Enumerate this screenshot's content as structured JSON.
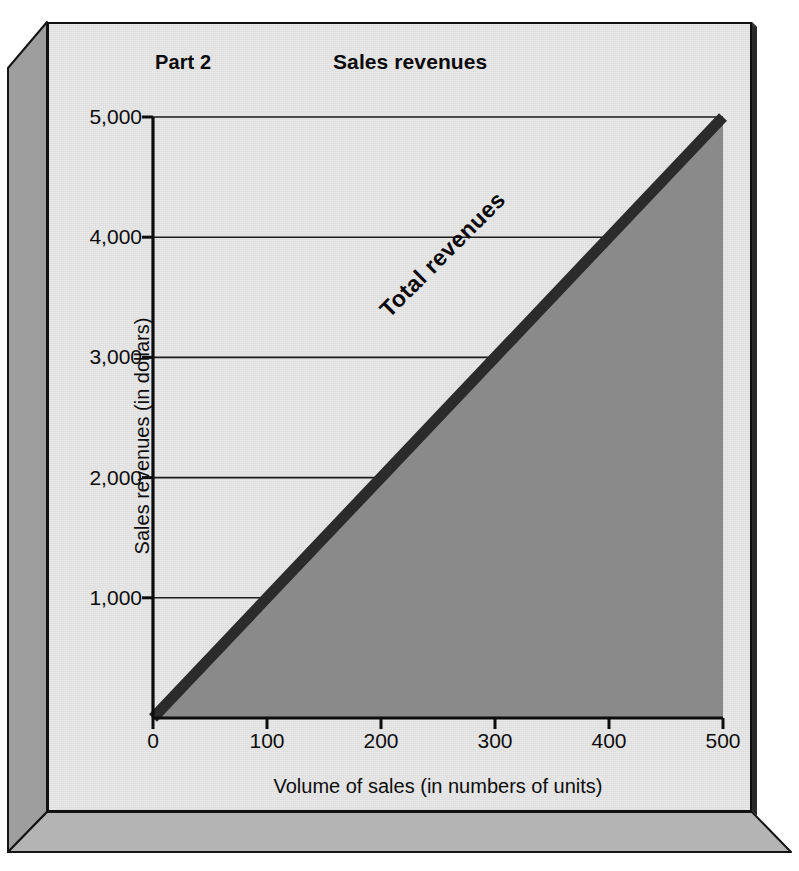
{
  "figure": {
    "part_label": "Part 2",
    "title": "Sales revenues",
    "background_color": "#e8e8e8",
    "border_color": "#101010",
    "bevel_color": "#9c9c9c"
  },
  "chart_data": {
    "type": "area",
    "title": "Sales revenues",
    "subtitle": "Part 2",
    "xlabel": "Volume of sales (in numbers of units)",
    "ylabel": "Sales revenues (in dollars)",
    "xlim": [
      0,
      500
    ],
    "ylim": [
      0,
      5000
    ],
    "xticks": [
      0,
      100,
      200,
      300,
      400,
      500
    ],
    "xtick_labels": [
      "0",
      "100",
      "200",
      "300",
      "400",
      "500"
    ],
    "yticks": [
      1000,
      2000,
      3000,
      4000,
      5000
    ],
    "ytick_labels": [
      "1,000",
      "2,000",
      "3,000",
      "4,000",
      "5,000"
    ],
    "grid": "horizontal",
    "legend_position": "inline-annotation",
    "series": [
      {
        "name": "Total revenues",
        "annotation": "Total revenues",
        "line_color": "#2b2b2b",
        "fill_color": "#8a8a8a",
        "line_width_px": 11,
        "unit_price_dollars_per_unit": 10,
        "x": [
          0,
          100,
          200,
          300,
          400,
          500
        ],
        "values": [
          0,
          1000,
          2000,
          3000,
          4000,
          5000
        ]
      }
    ]
  }
}
